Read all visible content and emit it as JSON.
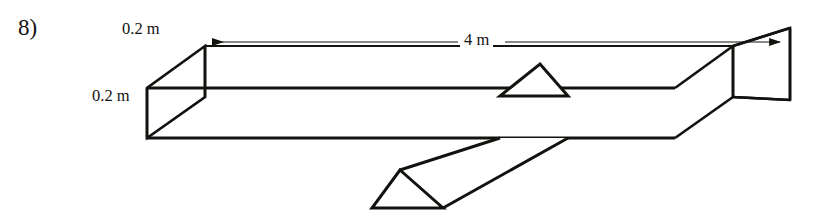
{
  "figure": {
    "problem_number": "8)",
    "background_color": "#ffffff",
    "line_color": "#14120f",
    "text_color": "#14120f"
  },
  "labels": {
    "width_dimension": "0.2 m",
    "height_dimension": "0.2 m",
    "length_dimension": "4 m"
  },
  "dimensions": {
    "beam_length": "4 m",
    "beam_width": "0.2 m",
    "beam_height": "0.2 m"
  },
  "geometry": {
    "view": "isometric",
    "beam": {
      "front_top_left": [
        205,
        46
      ],
      "front_top_right": [
        733,
        46
      ],
      "front_bottom_left": [
        205,
        97
      ],
      "front_bottom_right": [
        733,
        97
      ],
      "back_top_left": [
        147,
        88
      ],
      "back_top_right": [
        675,
        88
      ],
      "back_bottom_left": [
        147,
        138
      ],
      "back_bottom_right": [
        675,
        138
      ]
    },
    "left_end_face": [
      [
        205,
        46
      ],
      [
        147,
        88
      ],
      [
        147,
        138
      ],
      [
        205,
        97
      ]
    ],
    "right_end_face": [
      [
        733,
        46
      ],
      [
        790,
        28
      ],
      [
        790,
        100
      ],
      [
        733,
        97
      ]
    ],
    "fulcrum_prism": {
      "top_apex_front": [
        540,
        64
      ],
      "top_base_left": [
        500,
        96
      ],
      "top_base_right": [
        568,
        96
      ],
      "lower_apex": [
        400,
        170
      ],
      "lower_base_left": [
        372,
        208
      ],
      "lower_base_right": [
        443,
        208
      ]
    },
    "dimension_line": {
      "y": 42,
      "x_start": 207,
      "x_end": 786,
      "arrow_left_at": [
        209,
        42
      ],
      "arrow_right_at": [
        784,
        42
      ]
    }
  }
}
